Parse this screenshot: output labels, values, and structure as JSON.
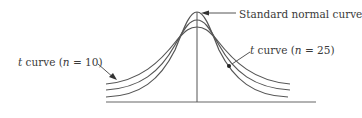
{
  "diagram": {
    "colors": {
      "curve": "#555555",
      "axis": "#666666",
      "text": "#3a3a3a",
      "background": "#ffffff"
    },
    "curves": [
      {
        "id": "standard-normal",
        "label_text": "Standard normal curve",
        "peak_y": 12,
        "tail_y": 97
      },
      {
        "id": "t25",
        "label_var": "t",
        "label_rest": " curve (",
        "label_n": "n",
        "label_eq": " = 25)",
        "peak_y": 20,
        "tail_y": 89
      },
      {
        "id": "t10",
        "label_var": "t",
        "label_rest": " curve (",
        "label_n": "n",
        "label_eq": " = 10)",
        "peak_y": 27,
        "tail_y": 83
      }
    ],
    "axis": {
      "x_start": 106,
      "x_end": 316,
      "y": 102,
      "center_x": 197,
      "center_top_y": 12
    }
  }
}
